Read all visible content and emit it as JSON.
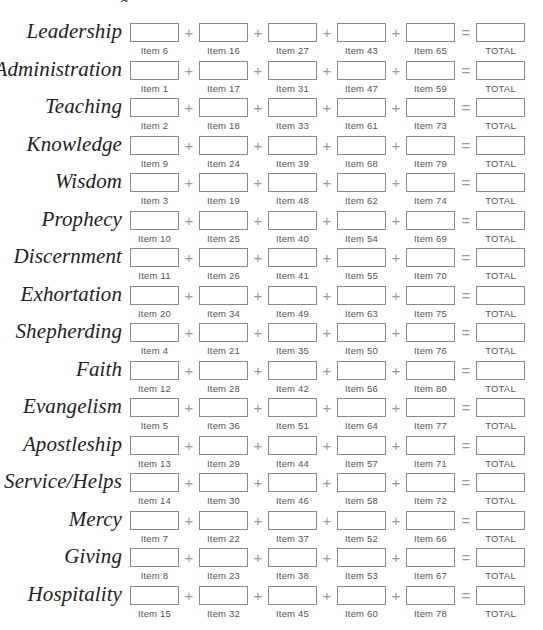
{
  "page": {
    "top_fragment": "g"
  },
  "operators": {
    "plus": "+",
    "equals": "="
  },
  "total_label": "TOTAL",
  "rows": [
    {
      "gift": "Leadership",
      "items": [
        "Item 6",
        "Item 16",
        "Item 27",
        "Item 43",
        "Item 65"
      ],
      "total": "TOTAL"
    },
    {
      "gift": "Administration",
      "items": [
        "Item 1",
        "Item 17",
        "Item 31",
        "Item 47",
        "Item 59"
      ],
      "total": "TOTAL"
    },
    {
      "gift": "Teaching",
      "items": [
        "Item 2",
        "Item 18",
        "Item 33",
        "Item 61",
        "Item 73"
      ],
      "total": "TOTAL"
    },
    {
      "gift": "Knowledge",
      "items": [
        "Item 9",
        "Item 24",
        "Item 39",
        "Item 68",
        "Item 79"
      ],
      "total": "TOTAL"
    },
    {
      "gift": "Wisdom",
      "items": [
        "Item 3",
        "Item 19",
        "Item 48",
        "Item 62",
        "Item 74"
      ],
      "total": "TOTAL"
    },
    {
      "gift": "Prophecy",
      "items": [
        "Item 10",
        "Item 25",
        "Item 40",
        "Item 54",
        "Item 69"
      ],
      "total": "TOTAL"
    },
    {
      "gift": "Discernment",
      "items": [
        "Item 11",
        "Item 26",
        "Item 41",
        "Item 55",
        "Item 70"
      ],
      "total": "TOTAL"
    },
    {
      "gift": "Exhortation",
      "items": [
        "Item 20",
        "Item 34",
        "Item 49",
        "Item 63",
        "Item 75"
      ],
      "total": "TOTAL"
    },
    {
      "gift": "Shepherding",
      "items": [
        "Item 4",
        "Item 21",
        "Item 35",
        "Item 50",
        "Item 76"
      ],
      "total": "TOTAL"
    },
    {
      "gift": "Faith",
      "items": [
        "Item 12",
        "Item 28",
        "Item 42",
        "Item 56",
        "Item 80"
      ],
      "total": "TOTAL"
    },
    {
      "gift": "Evangelism",
      "items": [
        "Item 5",
        "Item 36",
        "Item 51",
        "Item 64",
        "Item 77"
      ],
      "total": "TOTAL"
    },
    {
      "gift": "Apostleship",
      "items": [
        "Item 13",
        "Item 29",
        "Item 44",
        "Item 57",
        "Item 71"
      ],
      "total": "TOTAL"
    },
    {
      "gift": "Service/Helps",
      "items": [
        "Item 14",
        "Item 30",
        "Item 46",
        "Item 58",
        "Item 72"
      ],
      "total": "TOTAL"
    },
    {
      "gift": "Mercy",
      "items": [
        "Item 7",
        "Item 22",
        "Item 37",
        "Item 52",
        "Item 66"
      ],
      "total": "TOTAL"
    },
    {
      "gift": "Giving",
      "items": [
        "Item 8",
        "Item 23",
        "Item 38",
        "Item 53",
        "Item 67"
      ],
      "total": "TOTAL"
    },
    {
      "gift": "Hospitality",
      "items": [
        "Item 15",
        "Item 32",
        "Item 45",
        "Item 60",
        "Item 78"
      ],
      "total": "TOTAL"
    }
  ]
}
